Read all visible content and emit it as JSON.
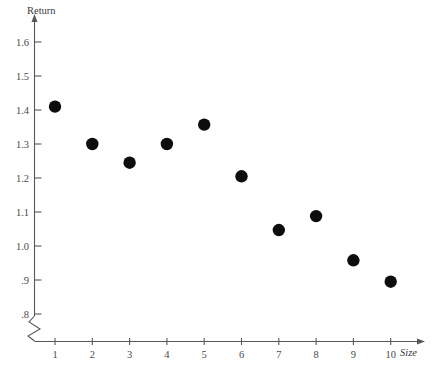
{
  "chart_data": {
    "type": "scatter",
    "title": "",
    "xlabel": "Size",
    "ylabel": "Return",
    "x": [
      1,
      2,
      3,
      4,
      5,
      6,
      7,
      8,
      9,
      10
    ],
    "values": [
      1.41,
      1.3,
      1.245,
      1.3,
      1.357,
      1.205,
      1.047,
      1.088,
      0.958,
      0.895
    ],
    "series": [
      {
        "name": "Return by Size",
        "values": [
          1.41,
          1.3,
          1.245,
          1.3,
          1.357,
          1.205,
          1.047,
          1.088,
          0.958,
          0.895
        ]
      }
    ],
    "points": [
      {
        "x": 1,
        "y": 1.41
      },
      {
        "x": 2,
        "y": 1.3
      },
      {
        "x": 3,
        "y": 1.245
      },
      {
        "x": 4,
        "y": 1.3
      },
      {
        "x": 5,
        "y": 1.357
      },
      {
        "x": 6,
        "y": 1.205
      },
      {
        "x": 7,
        "y": 1.047
      },
      {
        "x": 8,
        "y": 1.088
      },
      {
        "x": 9,
        "y": 0.958
      },
      {
        "x": 10,
        "y": 0.895
      }
    ],
    "xlim": [
      0,
      10.6
    ],
    "ylim": [
      0.8,
      1.65
    ],
    "xticks": [
      1,
      2,
      3,
      4,
      5,
      6,
      7,
      8,
      9,
      10
    ],
    "xtick_labels": [
      "1",
      "2",
      "3",
      "4",
      "5",
      "6",
      "7",
      "8",
      "9",
      "10"
    ],
    "yticks": [
      0.8,
      0.9,
      1.0,
      1.1,
      1.2,
      1.3,
      1.4,
      1.5,
      1.6
    ],
    "ytick_labels": [
      ".8",
      ".9",
      "1.0",
      "1.1",
      "1.2",
      "1.3",
      "1.4",
      "1.5",
      "1.6"
    ],
    "grid": false,
    "legend": false,
    "legend_position": "none",
    "axis_break_y": true,
    "annotations": [],
    "colors": {
      "marker": "#0d0d0d",
      "axis": "#585858",
      "tick_text": "#4a4a4a",
      "axis_title": "#3a3a3a",
      "background": "#ffffff"
    }
  },
  "axes": {
    "y_title": "Return",
    "x_title": "Size"
  }
}
